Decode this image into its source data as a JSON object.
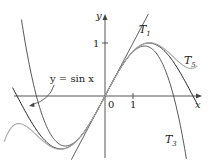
{
  "figure": {
    "axes": {
      "x_label": "x",
      "y_label": "y",
      "origin_label": "0",
      "x_tick_label": "1",
      "y_tick_label": "1"
    },
    "curves": [
      {
        "name": "sin",
        "label": "y = sin x",
        "color": "#222222"
      },
      {
        "name": "T1",
        "label": "T",
        "sub": "1",
        "color": "#333333"
      },
      {
        "name": "T3",
        "label": "T",
        "sub": "3",
        "color": "#444444"
      },
      {
        "name": "T5",
        "label": "T",
        "sub": "5",
        "color": "#aaaaaa"
      }
    ]
  }
}
